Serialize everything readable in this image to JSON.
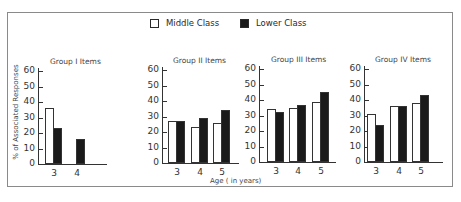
{
  "legend": {
    "middle_label": "Middle Class",
    "lower_label": "Lower Class"
  },
  "axes": {
    "ylabel": "% of Associated Responses",
    "xlabel": "Age ( in years)",
    "yticks": [
      "0",
      "10",
      "20",
      "30",
      "40",
      "50",
      "60"
    ]
  },
  "chart_data": {
    "type": "bar",
    "title": "",
    "xlabel": "Age ( in years)",
    "ylabel": "% of Associated Responses",
    "ylim": [
      0,
      60
    ],
    "yticks": [
      0,
      10,
      20,
      30,
      40,
      50,
      60
    ],
    "grid": false,
    "legend_position": "top-center",
    "legend": [
      "Middle Class",
      "Lower Class"
    ],
    "panels": [
      {
        "title": "Group I Items",
        "categories": [
          "3",
          "4"
        ],
        "series": [
          {
            "name": "Middle Class",
            "values": [
              36,
              0
            ]
          },
          {
            "name": "Lower Class",
            "values": [
              23,
              16
            ]
          }
        ]
      },
      {
        "title": "Group II Items",
        "categories": [
          "3",
          "4",
          "5"
        ],
        "series": [
          {
            "name": "Middle Class",
            "values": [
              27,
              23,
              26
            ]
          },
          {
            "name": "Lower Class",
            "values": [
              27,
              29,
              34
            ]
          }
        ]
      },
      {
        "title": "Group III Items",
        "categories": [
          "3",
          "4",
          "5"
        ],
        "series": [
          {
            "name": "Middle Class",
            "values": [
              34,
              35,
              39
            ]
          },
          {
            "name": "Lower Class",
            "values": [
              32,
              37,
              45
            ]
          }
        ]
      },
      {
        "title": "Group IV Items",
        "categories": [
          "3",
          "4",
          "5"
        ],
        "series": [
          {
            "name": "Middle Class",
            "values": [
              31,
              36,
              38
            ]
          },
          {
            "name": "Lower Class",
            "values": [
              24,
              36,
              43
            ]
          }
        ]
      }
    ]
  }
}
